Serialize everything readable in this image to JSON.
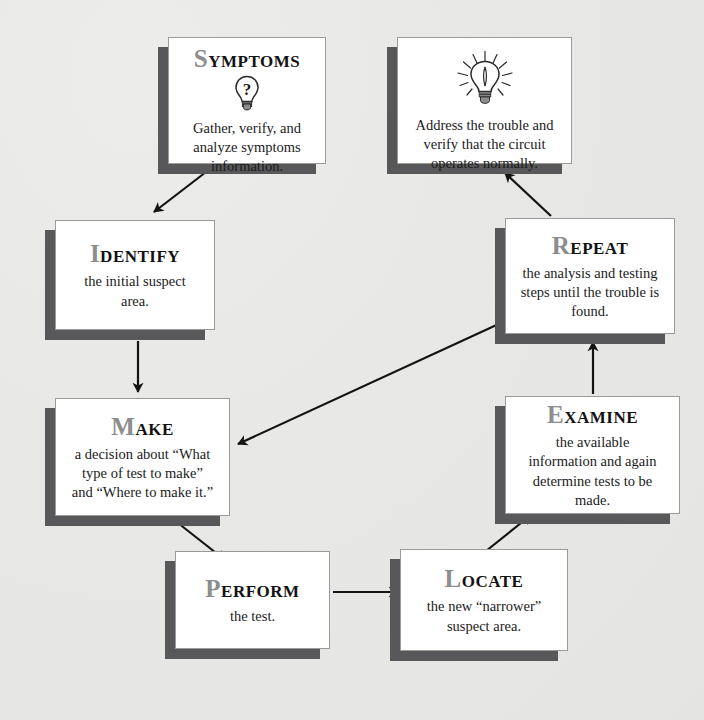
{
  "diagram": {
    "background_color": "#e9e9e7",
    "box_fill": "#ffffff",
    "box_border": "#9a9a98",
    "shadow_color": "#58585a",
    "initial_cap_color": "#8d8d8d",
    "arrow_color": "#111111"
  },
  "nodes": [
    {
      "id": "symptoms",
      "title_cap": "S",
      "title_rest": "YMPTOMS",
      "title_full": "SYMPTOMS",
      "icon": "question-mark-lightbulb-icon",
      "body": "Gather, verify, and analyze symptoms information."
    },
    {
      "id": "address",
      "title_cap": "",
      "title_rest": "",
      "title_full": "",
      "icon": "lit-lightbulb-icon",
      "body": "Address the trouble and verify that the circuit operates normally."
    },
    {
      "id": "identify",
      "title_cap": "I",
      "title_rest": "DENTIFY",
      "title_full": "IDENTIFY",
      "icon": "",
      "body": "the initial suspect area."
    },
    {
      "id": "repeat",
      "title_cap": "R",
      "title_rest": "EPEAT",
      "title_full": "REPEAT",
      "icon": "",
      "body": "the analysis and testing steps until the trouble is found."
    },
    {
      "id": "make",
      "title_cap": "M",
      "title_rest": "AKE",
      "title_full": "MAKE",
      "icon": "",
      "body": "a decision about “What type of test to make” and “Where to make it.”"
    },
    {
      "id": "examine",
      "title_cap": "E",
      "title_rest": "XAMINE",
      "title_full": "EXAMINE",
      "icon": "",
      "body": "the available information and again determine tests to be made."
    },
    {
      "id": "perform",
      "title_cap": "P",
      "title_rest": "ERFORM",
      "title_full": "PERFORM",
      "icon": "",
      "body": "the test."
    },
    {
      "id": "locate",
      "title_cap": "L",
      "title_rest": "OCATE",
      "title_full": "LOCATE",
      "icon": "",
      "body": "the new “narrower” suspect area."
    }
  ],
  "edges": [
    {
      "id": "symptoms-to-identify",
      "from": "symptoms",
      "to": "identify",
      "direction": "down-left"
    },
    {
      "id": "identify-to-make",
      "from": "identify",
      "to": "make",
      "direction": "down"
    },
    {
      "id": "make-to-perform",
      "from": "make",
      "to": "perform",
      "direction": "down-right"
    },
    {
      "id": "perform-to-locate",
      "from": "perform",
      "to": "locate",
      "direction": "right"
    },
    {
      "id": "locate-to-examine",
      "from": "locate",
      "to": "examine",
      "direction": "up-right"
    },
    {
      "id": "examine-to-repeat",
      "from": "examine",
      "to": "repeat",
      "direction": "up"
    },
    {
      "id": "repeat-to-address",
      "from": "repeat",
      "to": "address",
      "direction": "up-left"
    },
    {
      "id": "repeat-to-make",
      "from": "repeat",
      "to": "make",
      "direction": "down-left"
    }
  ]
}
